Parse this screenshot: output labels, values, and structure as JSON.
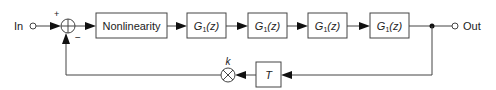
{
  "diagram": {
    "type": "block-diagram",
    "input_label": "In",
    "output_label": "Out",
    "summing_junction": {
      "plus_sign": "+",
      "minus_sign": "−"
    },
    "forward_blocks": [
      {
        "id": "nonlinearity",
        "label": "Nonlinearity"
      },
      {
        "id": "g1_a",
        "label_main": "G",
        "label_sub": "1",
        "label_arg": "(z)"
      },
      {
        "id": "g1_b",
        "label_main": "G",
        "label_sub": "1",
        "label_arg": "(z)"
      },
      {
        "id": "g1_c",
        "label_main": "G",
        "label_sub": "1",
        "label_arg": "(z)"
      },
      {
        "id": "g1_d",
        "label_main": "G",
        "label_sub": "1",
        "label_arg": "(z)"
      }
    ],
    "feedback": {
      "delay_block": {
        "label": "T"
      },
      "gain_multiplier": {
        "label": "k"
      }
    },
    "colors": {
      "line": "#444444",
      "arrow": "#111111",
      "text": "#222222",
      "background": "#ffffff"
    }
  }
}
